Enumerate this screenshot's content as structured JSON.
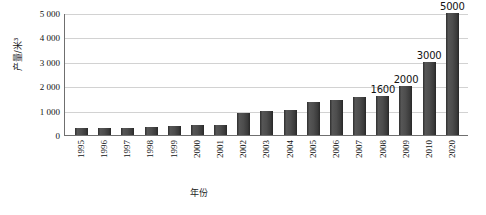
{
  "chart_data": {
    "type": "bar",
    "title": "",
    "xlabel": "年份",
    "ylabel": "产量/米³",
    "ylim": [
      0,
      5000
    ],
    "grid": true,
    "legend": "none",
    "y_ticks": [
      "0",
      "1 000",
      "2 000",
      "3 000",
      "4 000",
      "5 000"
    ],
    "y_tick_values": [
      0,
      1000,
      2000,
      3000,
      4000,
      5000
    ],
    "categories": [
      "1995",
      "1996",
      "1997",
      "1998",
      "1999",
      "2000",
      "2001",
      "2002",
      "2003",
      "2004",
      "2005",
      "2006",
      "2007",
      "2008",
      "2009",
      "2010",
      "2020"
    ],
    "values": [
      280,
      280,
      270,
      330,
      380,
      420,
      430,
      900,
      1000,
      1020,
      1350,
      1450,
      1550,
      1600,
      2000,
      3000,
      5000
    ],
    "data_labels": [
      "",
      "",
      "",
      "",
      "",
      "",
      "",
      "",
      "",
      "",
      "",
      "",
      "",
      "1600",
      "2000",
      "3000",
      "5000"
    ],
    "bar_color": "#4a4a4a",
    "gridline_color": "#d2d2d2",
    "axis_color": "#6f6f6f",
    "text_color": "#111111"
  }
}
